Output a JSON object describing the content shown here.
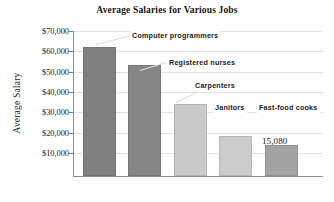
{
  "chart_data": {
    "type": "bar",
    "title": "Average Salaries for Various Jobs",
    "xlabel": "",
    "ylabel": "Average Salary",
    "categories": [
      "Computer programmers",
      "Registered nurses",
      "Carpenters",
      "Janitors",
      "Fast-food cooks"
    ],
    "values": [
      63500,
      54800,
      35500,
      19700,
      15080
    ],
    "ylim": [
      0,
      72000
    ],
    "yticks": [
      10000,
      20000,
      30000,
      40000,
      50000,
      60000,
      70000
    ],
    "ytick_labels": [
      "$10,000",
      "$20,000",
      "$30,000",
      "$40,000",
      "$50,000",
      "$60,000",
      "$70,000"
    ],
    "grid": true,
    "legend": false,
    "data_labels": [
      {
        "category": "Fast-food cooks",
        "text": "15,080"
      }
    ],
    "bar_colors": [
      "#808080",
      "#858585",
      "#c9c9c9",
      "#cccccc",
      "#a3a3a3"
    ]
  },
  "axis": {
    "y_title": "Average Salary",
    "ticks": [
      {
        "label": "$70,000",
        "value": 70000
      },
      {
        "label": "$60,000",
        "value": 60000
      },
      {
        "label": "$50,000",
        "value": 50000
      },
      {
        "label": "$40,000",
        "value": 40000
      },
      {
        "label": "$30,000",
        "value": 30000
      },
      {
        "label": "$20,000",
        "value": 20000
      },
      {
        "label": "$10,000",
        "value": 10000
      }
    ]
  },
  "callouts": [
    {
      "label": "Computer programmers"
    },
    {
      "label": "Registered nurses"
    },
    {
      "label": "Carpenters"
    },
    {
      "label": "Janitors"
    },
    {
      "label": "Fast-food cooks"
    }
  ],
  "value_labels": [
    {
      "text": "15,080"
    }
  ]
}
